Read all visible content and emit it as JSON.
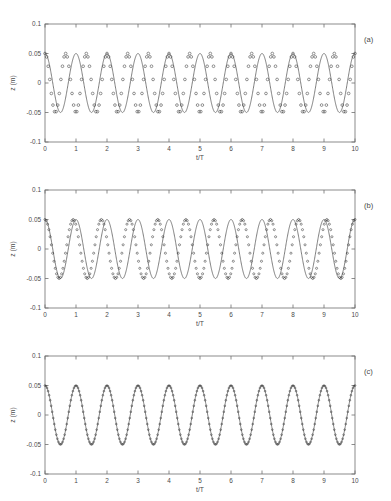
{
  "figure": {
    "panels": [
      {
        "tag": "(a)",
        "xlabel": "t/T",
        "ylabel": "z (m)",
        "xticks": [
          "0",
          "1",
          "2",
          "3",
          "4",
          "5",
          "6",
          "7",
          "8",
          "9",
          "10"
        ],
        "yticks": [
          "0.1",
          "0.05",
          "0",
          "-0.05",
          "-0.1"
        ]
      },
      {
        "tag": "(b)",
        "xlabel": "t/T",
        "ylabel": "z (m)",
        "xticks": [
          "0",
          "1",
          "2",
          "3",
          "4",
          "5",
          "6",
          "7",
          "8",
          "9",
          "10"
        ],
        "yticks": [
          "0.1",
          "0.05",
          "0",
          "-0.05",
          "-0.1"
        ]
      },
      {
        "tag": "(c)",
        "xlabel": "t/T",
        "ylabel": "z (m)",
        "xticks": [
          "0",
          "1",
          "2",
          "3",
          "4",
          "5",
          "6",
          "7",
          "8",
          "9",
          "10"
        ],
        "yticks": [
          "0.1",
          "0.05",
          "0",
          "-0.05",
          "-0.1"
        ]
      }
    ]
  },
  "chart_data": [
    {
      "type": "line",
      "title": "",
      "panel": "(a)",
      "xlabel": "t/T",
      "ylabel": "z (m)",
      "xlim": [
        0,
        10
      ],
      "ylim": [
        -0.1,
        0.1
      ],
      "xticks": [
        0,
        1,
        2,
        3,
        4,
        5,
        6,
        7,
        8,
        9,
        10
      ],
      "yticks": [
        -0.1,
        -0.05,
        0,
        0.05,
        0.1
      ],
      "grid": false,
      "legend": "none",
      "series": [
        {
          "name": "reference solution",
          "style": "solid-line",
          "form": "cosine",
          "amplitude": 0.05,
          "frequency_cycles_per_unit": 1.0,
          "phase_deg": 0,
          "n_cycles": 10
        },
        {
          "name": "numerical solution",
          "style": "open-circles",
          "form": "cosine",
          "amplitude": 0.05,
          "frequency_cycles_per_unit": 1.5,
          "phase_deg": 0,
          "n_cycles": 15,
          "samples_per_cycle": 13
        }
      ]
    },
    {
      "type": "line",
      "title": "",
      "panel": "(b)",
      "xlabel": "t/T",
      "ylabel": "z (m)",
      "xlim": [
        0,
        10
      ],
      "ylim": [
        -0.1,
        0.1
      ],
      "xticks": [
        0,
        1,
        2,
        3,
        4,
        5,
        6,
        7,
        8,
        9,
        10
      ],
      "yticks": [
        -0.1,
        -0.05,
        0,
        0.05,
        0.1
      ],
      "grid": false,
      "legend": "none",
      "series": [
        {
          "name": "reference solution",
          "style": "solid-line",
          "form": "cosine",
          "amplitude": 0.05,
          "frequency_cycles_per_unit": 1.0,
          "phase_deg": 0,
          "n_cycles": 10
        },
        {
          "name": "numerical solution",
          "style": "open-circles",
          "form": "cosine",
          "amplitude": 0.05,
          "frequency_cycles_per_unit": 1.1,
          "phase_deg": 0,
          "n_cycles": 11,
          "samples_per_cycle": 22
        }
      ]
    },
    {
      "type": "line",
      "title": "",
      "panel": "(c)",
      "xlabel": "t/T",
      "ylabel": "z (m)",
      "xlim": [
        0,
        10
      ],
      "ylim": [
        -0.1,
        0.1
      ],
      "xticks": [
        0,
        1,
        2,
        3,
        4,
        5,
        6,
        7,
        8,
        9,
        10
      ],
      "yticks": [
        -0.1,
        -0.05,
        0,
        0.05,
        0.1
      ],
      "grid": false,
      "legend": "none",
      "series": [
        {
          "name": "reference solution",
          "style": "solid-line",
          "form": "cosine",
          "amplitude": 0.05,
          "frequency_cycles_per_unit": 1.0,
          "phase_deg": 0,
          "n_cycles": 10
        },
        {
          "name": "numerical solution",
          "style": "open-circles",
          "form": "cosine",
          "amplitude": 0.05,
          "frequency_cycles_per_unit": 1.0,
          "phase_deg": 0,
          "n_cycles": 10,
          "samples_per_cycle": 30
        }
      ]
    }
  ]
}
